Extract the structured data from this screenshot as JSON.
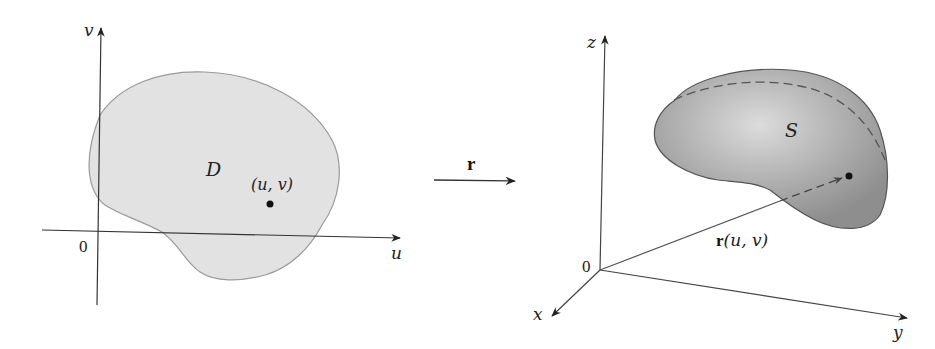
{
  "left_panel": {
    "axis_u_label": "u",
    "axis_v_label": "v",
    "origin_label": "0",
    "region_label": "D",
    "point_label": "(u, v)",
    "region_fill": "#e0e0e0",
    "region_stroke": "#9a9a9a"
  },
  "mapping": {
    "arrow_label": "r"
  },
  "right_panel": {
    "axis_x_label": "x",
    "axis_y_label": "y",
    "axis_z_label": "z",
    "origin_label": "0",
    "surface_label": "S",
    "vector_label_bold": "r",
    "vector_label_args": "(u, v)",
    "surface_fill": "#9a9a9a",
    "surface_highlight": "#dcdcdc"
  }
}
